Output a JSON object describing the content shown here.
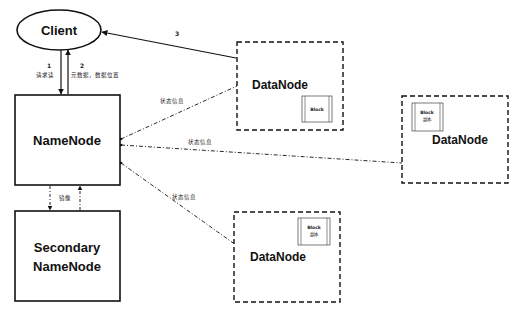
{
  "diagram": {
    "client": {
      "label": "Client"
    },
    "namenode": {
      "label": "NameNode"
    },
    "secondary": {
      "line1": "Secondary",
      "line2": "NameNode"
    },
    "datanodes": [
      {
        "label": "DataNode",
        "block": {
          "label": "Block",
          "sub": ""
        }
      },
      {
        "label": "DataNode",
        "block": {
          "label": "Block",
          "sub": "副本"
        }
      },
      {
        "label": "DataNode",
        "block": {
          "label": "Block",
          "sub": "副本"
        }
      }
    ],
    "edges": {
      "step1": {
        "num": "1",
        "label": "请求读"
      },
      "step2": {
        "num": "2",
        "label": "元数据，数据位置"
      },
      "step3": {
        "num": "3"
      },
      "status1": "状态信息",
      "status2": "状态信息",
      "status3": "状态信息",
      "mirror": "镜像"
    },
    "colors": {
      "stroke": "#111111",
      "background": "#ffffff"
    }
  }
}
